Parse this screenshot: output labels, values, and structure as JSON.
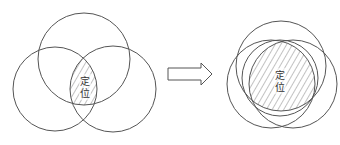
{
  "diagram": {
    "left": {
      "label_line1": "定",
      "label_line2": "位",
      "description": "Three partially overlapping circles; hatched central intersection"
    },
    "arrow": {
      "direction": "right",
      "style": "hollow"
    },
    "right": {
      "label_line1": "定",
      "label_line2": "位",
      "description": "Three nearly coincident circles; large hatched intersection"
    },
    "colors": {
      "stroke": "#555555",
      "hatch": "#666666",
      "background": "#ffffff"
    }
  }
}
